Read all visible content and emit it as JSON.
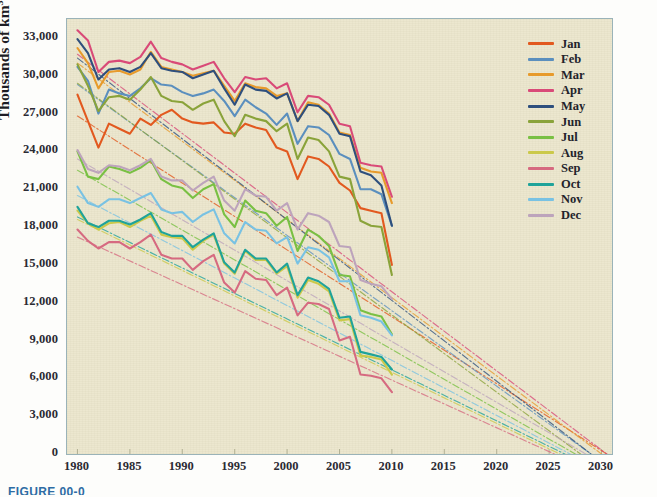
{
  "caption": "FIGURE 00-0",
  "axes": {
    "ylabel_text": "Thousands of km",
    "ylabel_sup": "3",
    "yticks": [
      "0",
      "3,000",
      "6,000",
      "9,000",
      "12,000",
      "15,000",
      "18,000",
      "21,000",
      "24,000",
      "27,000",
      "30,000",
      "33,000"
    ],
    "xticks": [
      "1980",
      "1985",
      "1990",
      "1995",
      "2000",
      "2005",
      "2010",
      "2015",
      "2020",
      "2025",
      "2030"
    ]
  },
  "legend": {
    "items": [
      {
        "label": "Jan",
        "color": "#e2591f"
      },
      {
        "label": "Feb",
        "color": "#5b8fbe"
      },
      {
        "label": "Mar",
        "color": "#e79a2b"
      },
      {
        "label": "Apr",
        "color": "#d94a78"
      },
      {
        "label": "May",
        "color": "#2e4f7d"
      },
      {
        "label": "Jun",
        "color": "#8aa33a"
      },
      {
        "label": "Jul",
        "color": "#79c043"
      },
      {
        "label": "Aug",
        "color": "#cbc94a"
      },
      {
        "label": "Sep",
        "color": "#d66a80"
      },
      {
        "label": "Oct",
        "color": "#1fa39a"
      },
      {
        "label": "Nov",
        "color": "#79c2e3"
      },
      {
        "label": "Dec",
        "color": "#bda4bc"
      }
    ]
  },
  "chart_data": {
    "type": "line",
    "title": "",
    "xlabel": "",
    "ylabel": "Thousands of km^3",
    "xlim": [
      1979,
      2031
    ],
    "ylim": [
      0,
      34500
    ],
    "grid": false,
    "legend_position": "right",
    "x": [
      1980,
      1981,
      1982,
      1983,
      1984,
      1985,
      1986,
      1987,
      1988,
      1989,
      1990,
      1991,
      1992,
      1993,
      1994,
      1995,
      1996,
      1997,
      1998,
      1999,
      2000,
      2001,
      2002,
      2003,
      2004,
      2005,
      2006,
      2007,
      2008,
      2009,
      2010
    ],
    "trend_x": [
      1980,
      2031
    ],
    "series": [
      {
        "name": "Jan",
        "color": "#e2591f",
        "values": [
          28500,
          26400,
          24300,
          26200,
          25800,
          25400,
          26600,
          26100,
          26900,
          27300,
          26600,
          26300,
          26200,
          26300,
          25500,
          25400,
          26200,
          25900,
          25700,
          24300,
          24000,
          21800,
          23600,
          23400,
          22800,
          21500,
          20900,
          19500,
          19300,
          19100,
          15000
        ],
        "trend": [
          26800,
          0
        ],
        "trend_end_year": 2030.5
      },
      {
        "name": "Feb",
        "color": "#5b8fbe",
        "values": [
          30700,
          29600,
          27000,
          28900,
          28600,
          28400,
          29000,
          29800,
          29300,
          29200,
          28700,
          28400,
          28600,
          28900,
          28000,
          26800,
          28100,
          27500,
          27000,
          26100,
          27000,
          24600,
          26000,
          25900,
          25300,
          23800,
          23400,
          21000,
          21000,
          20600,
          18100
        ],
        "trend": [
          29300,
          0
        ],
        "trend_end_year": 2029.0
      },
      {
        "name": "Mar",
        "color": "#e79a2b",
        "values": [
          32200,
          31000,
          29000,
          30300,
          30400,
          30100,
          30500,
          31900,
          30700,
          30500,
          30300,
          30000,
          30200,
          30400,
          29200,
          28000,
          29400,
          29100,
          29000,
          28400,
          28600,
          26400,
          27900,
          27700,
          27000,
          25500,
          25300,
          22700,
          22400,
          22300,
          19900
        ],
        "trend": [
          31000,
          0
        ],
        "trend_end_year": 2030.0
      },
      {
        "name": "Apr",
        "color": "#d94a78",
        "values": [
          33600,
          32800,
          30300,
          31100,
          31200,
          31000,
          31500,
          32700,
          31400,
          31100,
          30900,
          30500,
          30800,
          31100,
          29800,
          28700,
          29900,
          29700,
          29800,
          29000,
          29400,
          27100,
          28400,
          28300,
          27700,
          26200,
          26000,
          23100,
          22900,
          22800,
          20400
        ],
        "trend": [
          31700,
          0
        ],
        "trend_end_year": 2030.5
      },
      {
        "name": "May",
        "color": "#2e4f7d",
        "values": [
          32900,
          31800,
          29700,
          30500,
          30600,
          30300,
          30700,
          31800,
          30600,
          30400,
          30300,
          29800,
          30100,
          30400,
          29000,
          27700,
          29300,
          28900,
          28800,
          28200,
          28600,
          26400,
          27700,
          27600,
          26900,
          25400,
          25200,
          22400,
          22100,
          21300,
          18100
        ],
        "trend": [
          31400,
          0
        ],
        "trend_end_year": 2029.0
      },
      {
        "name": "Jun",
        "color": "#8aa33a",
        "values": [
          30900,
          29200,
          27200,
          28300,
          28400,
          28100,
          28900,
          29900,
          28400,
          28000,
          27900,
          27300,
          27800,
          28100,
          26400,
          25200,
          26900,
          26600,
          26400,
          25600,
          26200,
          23400,
          25100,
          24900,
          24000,
          22000,
          21800,
          18500,
          18100,
          18000,
          14200
        ],
        "trend": [
          29400,
          0
        ],
        "trend_end_year": 2028.0
      },
      {
        "name": "Jul",
        "color": "#79c043",
        "values": [
          24000,
          22000,
          21800,
          22800,
          22600,
          22300,
          22700,
          23300,
          21800,
          21300,
          21100,
          20300,
          21000,
          21400,
          19000,
          18000,
          20100,
          19300,
          19100,
          18100,
          18800,
          16100,
          17800,
          17300,
          16500,
          14200,
          14100,
          11400,
          11100,
          10900,
          9500
        ],
        "trend": [
          22500,
          0
        ],
        "trend_end_year": 2027.5
      },
      {
        "name": "Aug",
        "color": "#cbc94a",
        "values": [
          19300,
          18300,
          17800,
          18300,
          18400,
          18000,
          18500,
          18900,
          17400,
          17200,
          17100,
          16200,
          16900,
          17400,
          15100,
          14300,
          16100,
          15400,
          15400,
          14300,
          14900,
          12400,
          13800,
          13500,
          12900,
          10600,
          10700,
          7800,
          7700,
          7500,
          6300
        ],
        "trend": [
          18600,
          0
        ],
        "trend_end_year": 2026.0
      },
      {
        "name": "Sep",
        "color": "#d66a80",
        "values": [
          17800,
          16900,
          16300,
          16800,
          16800,
          16300,
          16800,
          17400,
          15800,
          15500,
          15500,
          14600,
          15300,
          15800,
          13600,
          12800,
          14500,
          13900,
          13800,
          12600,
          13200,
          11000,
          12000,
          11900,
          11500,
          9000,
          9300,
          6300,
          6200,
          6000,
          4900
        ],
        "trend": [
          17200,
          0
        ],
        "trend_end_year": 2025.5
      },
      {
        "name": "Oct",
        "color": "#1fa39a",
        "values": [
          19600,
          18300,
          18000,
          18500,
          18500,
          18200,
          18600,
          19100,
          17600,
          17300,
          17300,
          16400,
          17000,
          17500,
          15200,
          14400,
          16200,
          15500,
          15500,
          14400,
          15100,
          12600,
          14000,
          13700,
          13100,
          10800,
          10900,
          8100,
          7900,
          7700,
          6700
        ],
        "trend": [
          18800,
          0
        ],
        "trend_end_year": 2026.5
      },
      {
        "name": "Nov",
        "color": "#79c2e3",
        "values": [
          21200,
          19900,
          19600,
          20200,
          20200,
          19900,
          20300,
          20700,
          19400,
          19100,
          19200,
          18400,
          19000,
          19400,
          17500,
          16700,
          18400,
          17800,
          17700,
          16700,
          17200,
          15100,
          16400,
          16200,
          15600,
          13700,
          13700,
          11000,
          10800,
          10500,
          9400
        ],
        "trend": [
          20500,
          0
        ],
        "trend_end_year": 2027.0
      },
      {
        "name": "Dec",
        "color": "#bda4bc",
        "values": [
          24100,
          22600,
          22300,
          22900,
          22800,
          22500,
          22900,
          23400,
          22000,
          21700,
          21700,
          20900,
          21500,
          22000,
          20100,
          19300,
          21000,
          20500,
          20400,
          19300,
          19900,
          17800,
          19100,
          18900,
          18400,
          16500,
          16400,
          13800,
          13500,
          13300,
          12300
        ],
        "trend": [
          23400,
          0
        ],
        "trend_end_year": 2028.5
      }
    ]
  }
}
